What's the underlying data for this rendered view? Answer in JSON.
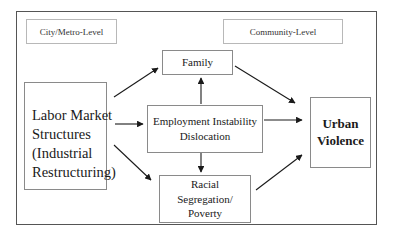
{
  "diagram": {
    "levels": {
      "city_metro": "City/Metro-Level",
      "community": "Community-Level"
    },
    "nodes": {
      "labor_market": {
        "line1": "Labor Market",
        "line2": "Structures",
        "line3": "(Industrial",
        "line4": "Restructuring)"
      },
      "family": {
        "label": "Family"
      },
      "employment": {
        "line1": "Employment Instability",
        "line2": "Dislocation"
      },
      "racial": {
        "line1": "Racial",
        "line2": "Segregation/",
        "line3": "Poverty"
      },
      "urban_violence": {
        "line1": "Urban",
        "line2": "Violence"
      }
    },
    "edges": [
      {
        "from": "Labor Market Structures",
        "to": "Family"
      },
      {
        "from": "Labor Market Structures",
        "to": "Employment Instability Dislocation"
      },
      {
        "from": "Labor Market Structures",
        "to": "Racial Segregation/Poverty"
      },
      {
        "from": "Employment Instability Dislocation",
        "to": "Family"
      },
      {
        "from": "Employment Instability Dislocation",
        "to": "Racial Segregation/Poverty"
      },
      {
        "from": "Family",
        "to": "Urban Violence"
      },
      {
        "from": "Employment Instability Dislocation",
        "to": "Urban Violence"
      },
      {
        "from": "Racial Segregation/Poverty",
        "to": "Urban Violence"
      }
    ],
    "colors": {
      "border": "#555555",
      "box_border": "#8a8a8a",
      "arrow": "#1a1a1a"
    }
  }
}
